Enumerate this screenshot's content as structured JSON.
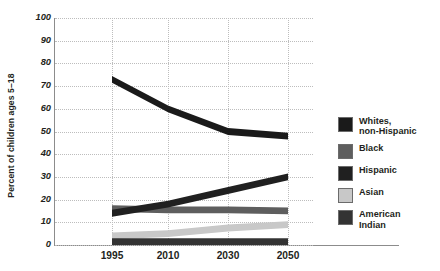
{
  "chart_data": {
    "type": "area",
    "title": "",
    "subtitle": "",
    "xlabel": "",
    "ylabel": "Percent of children ages 5–18",
    "categories": [
      "1995",
      "2010",
      "2030",
      "2050"
    ],
    "x_tick_labels": [
      "1995",
      "2010",
      "2030",
      "2050"
    ],
    "y_tick_labels": [
      "0",
      "10",
      "20",
      "30",
      "40",
      "50",
      "60",
      "70",
      "80",
      "90",
      "100"
    ],
    "ylim": [
      0,
      100
    ],
    "y_major_step": 10,
    "grid": "dotted horizontal and vertical gridlines",
    "legend_position": "right",
    "series": [
      {
        "name": "Whites, non-Hispanic",
        "legend_label": "Whites,\nnon-Hispanic",
        "color": "#1a1a1a",
        "values": [
          73,
          60,
          50,
          48
        ]
      },
      {
        "name": "Black",
        "legend_label": "Black",
        "color": "#5e5e5e",
        "values": [
          16,
          15.5,
          15.5,
          15
        ]
      },
      {
        "name": "Hispanic",
        "legend_label": "Hispanic",
        "color": "#202020",
        "values": [
          14,
          18,
          24,
          30
        ]
      },
      {
        "name": "Asian",
        "legend_label": "Asian",
        "color": "#c8c8c8",
        "values": [
          4,
          5,
          7.5,
          9
        ]
      },
      {
        "name": "American Indian",
        "legend_label": "American\nIndian",
        "color": "#333333",
        "values": [
          1.5,
          1.5,
          1.5,
          1.5
        ]
      }
    ],
    "band_thickness_percent": 3.0
  },
  "legend": {
    "items": [
      {
        "label": "Whites,\nnon-Hispanic",
        "color": "#1a1a1a"
      },
      {
        "label": "Black",
        "color": "#5e5e5e"
      },
      {
        "label": "Hispanic",
        "color": "#202020"
      },
      {
        "label": "Asian",
        "color": "#c8c8c8"
      },
      {
        "label": "American\nIndian",
        "color": "#333333"
      }
    ]
  },
  "axes": {
    "y_title": "Percent of children ages 5–18",
    "y_ticks": [
      "100",
      "90",
      "80",
      "70",
      "60",
      "50",
      "40",
      "30",
      "20",
      "10",
      "0"
    ],
    "x_ticks": [
      "1995",
      "2010",
      "2030",
      "2050"
    ]
  }
}
